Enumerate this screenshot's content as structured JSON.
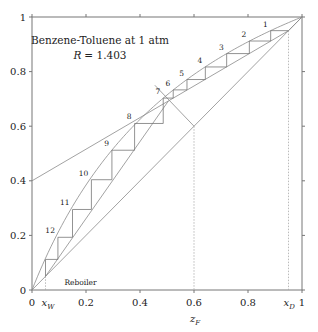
{
  "chart_data": {
    "type": "line",
    "title": "Benzene-Toluene at 1 atm",
    "subtitle": "R = 1.403",
    "subtitle_var": "R",
    "subtitle_value": "= 1.403",
    "xlabel": "z_F",
    "ylabel": "",
    "xlim": [
      0,
      1
    ],
    "ylim": [
      0,
      1
    ],
    "grid": false,
    "x_ticks": [
      0,
      0.2,
      0.4,
      0.6,
      0.8,
      1
    ],
    "x_tick_labels": [
      "0",
      "0.2",
      "0.4",
      "0.6",
      "0.8",
      "1"
    ],
    "y_ticks": [
      0,
      0.2,
      0.4,
      0.6,
      0.8,
      1
    ],
    "y_tick_labels": [
      "0",
      "0.2",
      "0.4",
      "0.6",
      "0.8",
      "1"
    ],
    "annotations": {
      "xW": {
        "label": "x",
        "sub": "W",
        "value": 0.05
      },
      "xD": {
        "label": "x",
        "sub": "D",
        "value": 0.95
      },
      "zF": {
        "label": "z",
        "sub": "F",
        "value": 0.6
      },
      "reboiler": "Reboiler"
    },
    "relative_volatility": 2.5,
    "series": [
      {
        "name": "diagonal",
        "points": [
          [
            0,
            0
          ],
          [
            1,
            1
          ]
        ]
      },
      {
        "name": "equilibrium_curve",
        "alpha": 2.5
      },
      {
        "name": "rectifying_line",
        "points": [
          [
            0,
            0.4
          ],
          [
            0.95,
            0.95
          ]
        ]
      },
      {
        "name": "stripping_line",
        "points": [
          [
            0.05,
            0.05
          ],
          [
            0.505,
            0.692
          ]
        ]
      },
      {
        "name": "q_line",
        "points": [
          [
            0.6,
            0.6
          ],
          [
            0.455,
            0.75
          ]
        ]
      }
    ],
    "stages": [
      {
        "label": "1",
        "x": 0.884,
        "y": 0.95
      },
      {
        "label": "2",
        "x": 0.805,
        "y": 0.912
      },
      {
        "label": "3",
        "x": 0.721,
        "y": 0.866
      },
      {
        "label": "4",
        "x": 0.642,
        "y": 0.817
      },
      {
        "label": "5",
        "x": 0.574,
        "y": 0.771
      },
      {
        "label": "6",
        "x": 0.523,
        "y": 0.733
      },
      {
        "label": "7",
        "x": 0.486,
        "y": 0.703
      },
      {
        "label": "8",
        "x": 0.38,
        "y": 0.61
      },
      {
        "label": "9",
        "x": 0.296,
        "y": 0.512
      },
      {
        "label": "10",
        "x": 0.22,
        "y": 0.404
      },
      {
        "label": "11",
        "x": 0.15,
        "y": 0.295
      },
      {
        "label": "12",
        "x": 0.096,
        "y": 0.193
      },
      {
        "label": "Reboiler",
        "x": 0.05,
        "y": 0.112
      }
    ]
  }
}
